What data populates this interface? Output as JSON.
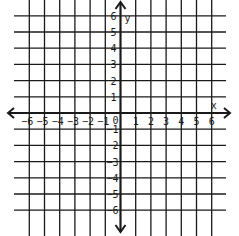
{
  "diagram": {
    "type": "coordinate-plane",
    "x_axis": {
      "label": "x",
      "min": -6,
      "max": 6,
      "tick_labels": [
        "-6",
        "-5",
        "-4",
        "-3",
        "-2",
        "-1",
        "1",
        "2",
        "3",
        "4",
        "5",
        "6"
      ],
      "origin_label": "0"
    },
    "y_axis": {
      "label": "y",
      "min": -6,
      "max": 6,
      "tick_labels_positive": [
        "1",
        "2",
        "3",
        "4",
        "5",
        "6"
      ],
      "tick_labels_negative": [
        "-1",
        "-2",
        "-3",
        "-4",
        "-5",
        "-6"
      ]
    },
    "grid": true,
    "line_color": "#1a1a1a",
    "background": "#ffffff"
  }
}
